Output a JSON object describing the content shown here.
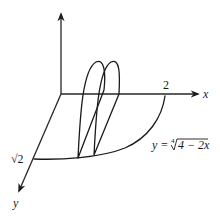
{
  "diagram": {
    "type": "3d-solid-cross-section",
    "axes": {
      "x_label": "x",
      "y_label": "y",
      "z_label": ""
    },
    "ticks": {
      "x_intercept": "2",
      "y_intercept": "√2"
    },
    "curve_label": {
      "lhs": "y = ",
      "root_index": "4",
      "radicand": "4 − 2x"
    },
    "cross_sections": 2,
    "colors": {
      "ink": "#1a1a1a",
      "background": "#ffffff"
    }
  }
}
